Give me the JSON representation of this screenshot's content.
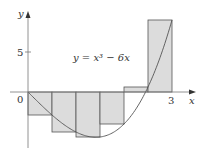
{
  "diagram": {
    "equation_label": "y = x³ − 6x",
    "x_axis_label": "x",
    "y_axis_label": "y",
    "origin_label": "0",
    "x_tick_label": "3",
    "y_tick_label": "5",
    "colors": {
      "rect_fill": "#dcdcdc",
      "rect_stroke": "#555555",
      "curve": "#555555",
      "axis": "#777777",
      "text": "#333333"
    }
  },
  "chart_data": {
    "type": "area",
    "title": "y = x³ − 6x",
    "function": "x^3 - 6x",
    "xlabel": "x",
    "ylabel": "y",
    "xlim": [
      0,
      3
    ],
    "x_ticks": [
      0,
      3
    ],
    "y_ticks": [
      5
    ],
    "riemann_sum": {
      "method": "right endpoints",
      "n": 6,
      "delta_x": 0.5,
      "intervals": [
        [
          0,
          0.5
        ],
        [
          0.5,
          1
        ],
        [
          1,
          1.5
        ],
        [
          1.5,
          2
        ],
        [
          2,
          2.5
        ],
        [
          2.5,
          3
        ]
      ],
      "heights": [
        -2.875,
        -5,
        -5.625,
        -4,
        0.625,
        9
      ]
    }
  }
}
